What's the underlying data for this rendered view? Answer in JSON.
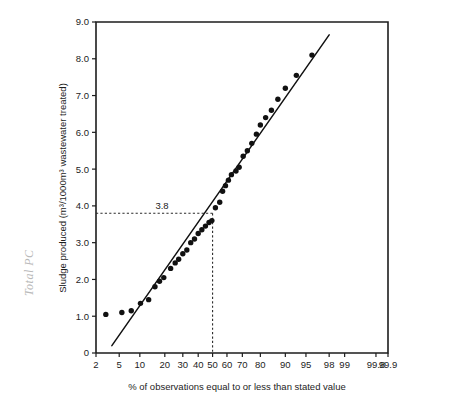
{
  "chart_data": {
    "type": "scatter",
    "title": "",
    "xlabel": "% of observations equal to or less than stated value",
    "ylabel": "Sludge produced (m³/1000m³ wastewater treated)",
    "x_scale": "normal-probability",
    "xlim": [
      2,
      99.9
    ],
    "ylim": [
      0,
      9.0
    ],
    "grid": false,
    "legend": null,
    "y_ticks": [
      "0",
      "1.0",
      "2.0",
      "3.0",
      "4.0",
      "5.0",
      "6.0",
      "7.0",
      "8.0",
      "9.0"
    ],
    "y_tick_values": [
      0,
      1,
      2,
      3,
      4,
      5,
      6,
      7,
      8,
      9
    ],
    "x_ticks": [
      "2",
      "5",
      "10",
      "20",
      "30",
      "40",
      "50",
      "60",
      "70",
      "80",
      "90",
      "95",
      "98",
      "99",
      "99.8",
      "99.9"
    ],
    "x_tick_values": [
      2,
      5,
      10,
      20,
      30,
      40,
      50,
      60,
      70,
      80,
      90,
      95,
      98,
      99,
      99.8,
      99.9
    ],
    "points": [
      [
        3.0,
        1.05
      ],
      [
        5.5,
        1.1
      ],
      [
        7.6,
        1.15
      ],
      [
        10.2,
        1.35
      ],
      [
        13.0,
        1.45
      ],
      [
        15.5,
        1.8
      ],
      [
        17.5,
        1.95
      ],
      [
        19.5,
        2.05
      ],
      [
        23.0,
        2.3
      ],
      [
        25.5,
        2.45
      ],
      [
        27.5,
        2.55
      ],
      [
        30.0,
        2.7
      ],
      [
        32.5,
        2.8
      ],
      [
        35.0,
        3.0
      ],
      [
        37.5,
        3.1
      ],
      [
        40.0,
        3.25
      ],
      [
        42.5,
        3.35
      ],
      [
        45.0,
        3.45
      ],
      [
        47.5,
        3.55
      ],
      [
        49.5,
        3.6
      ],
      [
        52.0,
        3.95
      ],
      [
        55.0,
        4.1
      ],
      [
        57.0,
        4.4
      ],
      [
        59.0,
        4.55
      ],
      [
        61.0,
        4.7
      ],
      [
        63.0,
        4.85
      ],
      [
        66.0,
        4.95
      ],
      [
        68.0,
        5.05
      ],
      [
        70.5,
        5.35
      ],
      [
        73.0,
        5.5
      ],
      [
        75.5,
        5.7
      ],
      [
        78.0,
        5.95
      ],
      [
        80.0,
        6.2
      ],
      [
        82.5,
        6.4
      ],
      [
        85.0,
        6.6
      ],
      [
        87.5,
        6.9
      ],
      [
        90.0,
        7.2
      ],
      [
        93.0,
        7.55
      ],
      [
        96.0,
        8.1
      ]
    ],
    "fit_line": {
      "x_start": 3.8,
      "y_start": 0.2,
      "x_end": 98.0,
      "y_end": 8.65,
      "description": "straight reference line fitted through the plotted distribution"
    },
    "annotations": [
      {
        "label": "3.8",
        "type": "reference-crosshair",
        "x_percent": 50,
        "y_value": 3.8,
        "horizontal_dashed_from_x": 2,
        "vertical_dashed_to_y": 0
      }
    ]
  },
  "margin_note": {
    "text": "Total PC",
    "visible": true
  }
}
